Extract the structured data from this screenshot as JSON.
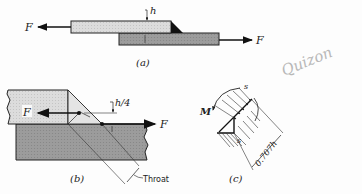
{
  "figure": {
    "parts": {
      "a": {
        "caption": "(a)",
        "force_left_label": "F",
        "force_right_label": "F",
        "thickness_label": "h"
      },
      "b": {
        "caption": "(b)",
        "force_left_label": "F",
        "force_right_label": "F",
        "offset_label": "h/4",
        "throat_label": "Throat"
      },
      "c": {
        "caption": "(c)",
        "moment_label": "M",
        "stress_label_top": "s",
        "stress_label_bottom": "s",
        "dimension_label": "0.707h"
      }
    },
    "annotation": {
      "handwritten_text": "Quizon"
    },
    "colors": {
      "upper_plate": "#e2e2e2",
      "lower_plate": "#9a9a9a",
      "weld": "#111111",
      "ink": "#222222",
      "pencil": "#b8b8b8"
    }
  }
}
